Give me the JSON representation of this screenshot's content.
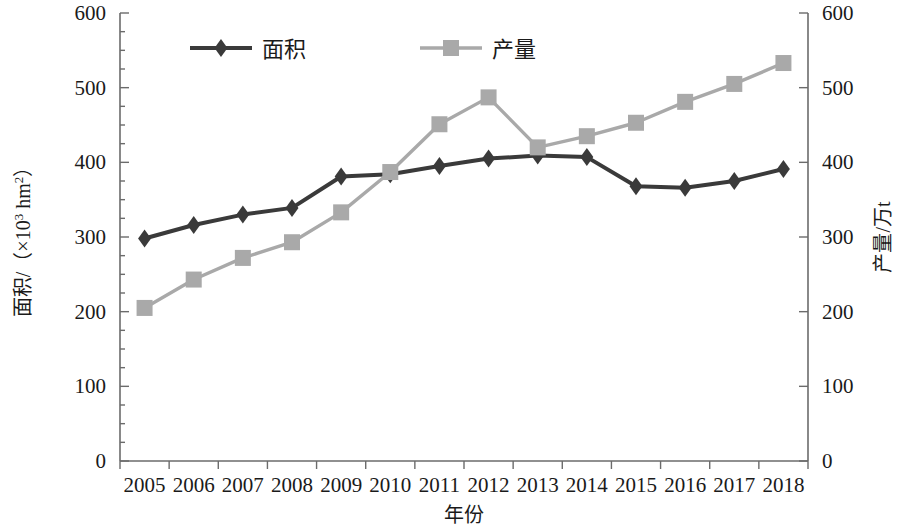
{
  "chart_data": {
    "type": "line",
    "title": "",
    "subtitle": "",
    "xlabel": "年份",
    "ylabel": "面积/（×10³ hm²）",
    "y2label": "产量/万t",
    "grid": false,
    "legend_position": "top-inside",
    "categories": [
      "2005",
      "2006",
      "2007",
      "2008",
      "2009",
      "2010",
      "2011",
      "2012",
      "2013",
      "2014",
      "2015",
      "2016",
      "2017",
      "2018"
    ],
    "ylim": [
      0,
      600
    ],
    "y2lim": [
      0,
      600
    ],
    "yticks": [
      0,
      100,
      200,
      300,
      400,
      500,
      600
    ],
    "y2ticks": [
      0,
      100,
      200,
      300,
      400,
      500,
      600
    ],
    "minor_tick_step": 25,
    "series": [
      {
        "name": "面积",
        "axis": "left",
        "marker": "diamond",
        "color": "#3a3a3a",
        "values": [
          298,
          316,
          330,
          339,
          381,
          384,
          395,
          405,
          409,
          407,
          368,
          366,
          375,
          391
        ]
      },
      {
        "name": "产量",
        "axis": "right",
        "marker": "square",
        "color": "#a9a9a9",
        "values": [
          205,
          243,
          272,
          293,
          333,
          387,
          451,
          487,
          420,
          435,
          453,
          481,
          505,
          533
        ]
      }
    ]
  },
  "legend": {
    "items": [
      {
        "label": "面积",
        "marker": "diamond",
        "color": "#3a3a3a"
      },
      {
        "label": "产量",
        "marker": "square",
        "color": "#a9a9a9"
      }
    ]
  },
  "axis_titles": {
    "left_main": "面积/（×10",
    "left_exp": "3",
    "left_unit": " hm",
    "left_unit_exp": "2",
    "left_close": "）",
    "right": "产量/万t",
    "bottom": "年份"
  }
}
